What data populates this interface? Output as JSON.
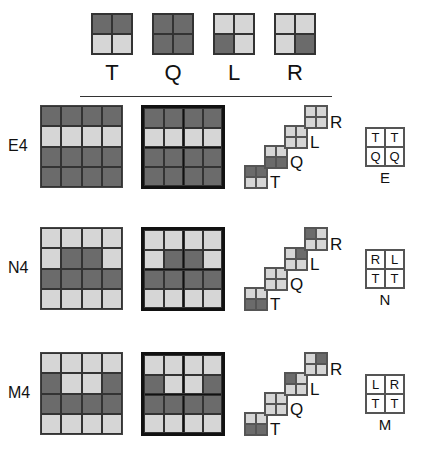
{
  "legend": {
    "tiles": [
      {
        "label": "T",
        "cells": [
          "d",
          "d",
          "l",
          "l"
        ]
      },
      {
        "label": "Q",
        "cells": [
          "d",
          "d",
          "d",
          "d"
        ]
      },
      {
        "label": "L",
        "cells": [
          "l",
          "l",
          "d",
          "l"
        ]
      },
      {
        "label": "R",
        "cells": [
          "l",
          "l",
          "l",
          "d"
        ]
      }
    ]
  },
  "rows": [
    {
      "label": "E4",
      "grid": [
        "d",
        "d",
        "d",
        "d",
        "l",
        "l",
        "l",
        "l",
        "d",
        "d",
        "d",
        "d",
        "d",
        "d",
        "d",
        "d"
      ],
      "stack": [
        {
          "label": "T",
          "cells": [
            "d",
            "d",
            "l",
            "l"
          ]
        },
        {
          "label": "Q",
          "cells": [
            "l",
            "l",
            "d",
            "d"
          ]
        },
        {
          "label": "L",
          "cells": [
            "l",
            "l",
            "l",
            "l"
          ]
        },
        {
          "label": "R",
          "cells": [
            "l",
            "l",
            "l",
            "l"
          ]
        }
      ],
      "layout": {
        "name": "E",
        "cells": [
          "T",
          "T",
          "Q",
          "Q"
        ]
      }
    },
    {
      "label": "N4",
      "grid": [
        "l",
        "l",
        "l",
        "l",
        "l",
        "d",
        "d",
        "l",
        "d",
        "d",
        "d",
        "d",
        "l",
        "l",
        "l",
        "l"
      ],
      "stack": [
        {
          "label": "T",
          "cells": [
            "l",
            "l",
            "d",
            "d"
          ]
        },
        {
          "label": "Q",
          "cells": [
            "l",
            "l",
            "l",
            "l"
          ]
        },
        {
          "label": "L",
          "cells": [
            "l",
            "d",
            "l",
            "l"
          ]
        },
        {
          "label": "R",
          "cells": [
            "d",
            "l",
            "l",
            "l"
          ]
        }
      ],
      "layout": {
        "name": "N",
        "cells": [
          "R",
          "L",
          "T",
          "T"
        ]
      }
    },
    {
      "label": "M4",
      "grid": [
        "l",
        "l",
        "l",
        "l",
        "d",
        "l",
        "l",
        "d",
        "d",
        "d",
        "d",
        "d",
        "l",
        "l",
        "l",
        "l"
      ],
      "stack": [
        {
          "label": "T",
          "cells": [
            "l",
            "l",
            "d",
            "d"
          ]
        },
        {
          "label": "Q",
          "cells": [
            "l",
            "l",
            "l",
            "l"
          ]
        },
        {
          "label": "L",
          "cells": [
            "d",
            "l",
            "l",
            "l"
          ]
        },
        {
          "label": "R",
          "cells": [
            "l",
            "d",
            "l",
            "l"
          ]
        }
      ],
      "layout": {
        "name": "M",
        "cells": [
          "L",
          "R",
          "T",
          "T"
        ]
      }
    }
  ],
  "colors": {
    "dark": "#6b6b6b",
    "light": "#d6d6d6"
  }
}
